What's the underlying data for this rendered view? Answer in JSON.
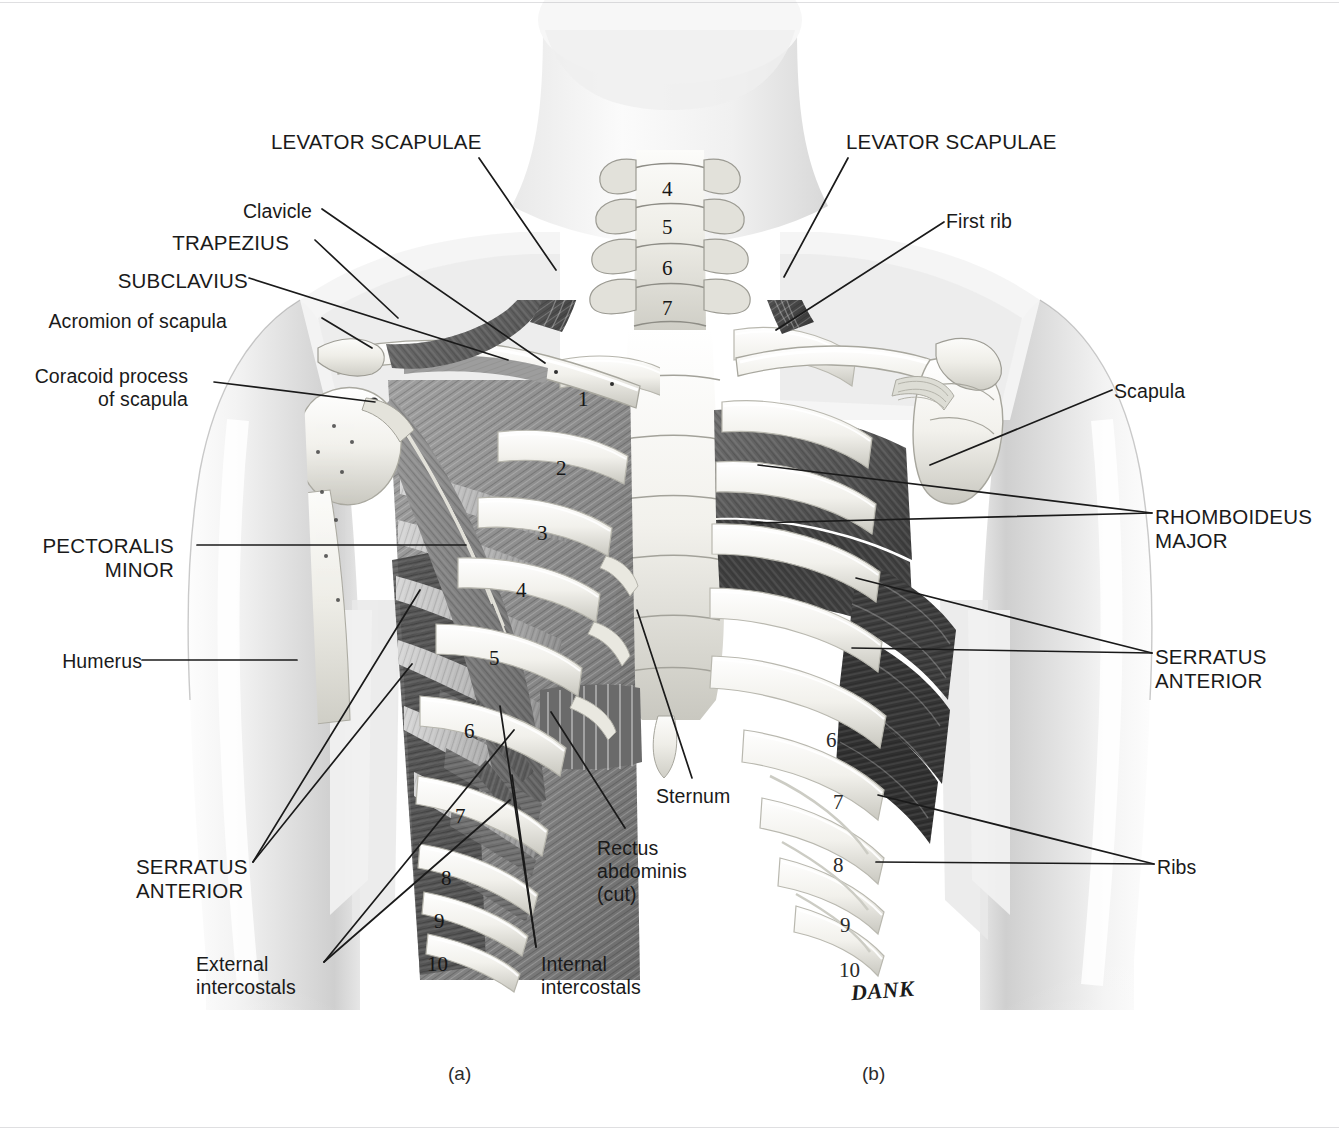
{
  "figure": {
    "type": "anatomical-illustration",
    "background_color": "#ffffff",
    "label_color": "#1a1a1a",
    "signature": "DANK"
  },
  "captions": [
    {
      "text": "(a)",
      "x": 448,
      "y": 1063
    },
    {
      "text": "(b)",
      "x": 862,
      "y": 1063
    }
  ],
  "labels": [
    {
      "id": "levator-scapulae-left",
      "text": "LEVATOR SCAPULAE",
      "style": "caps",
      "align": "ta-l",
      "x": 271,
      "y": 130
    },
    {
      "id": "levator-scapulae-right",
      "text": "LEVATOR SCAPULAE",
      "style": "caps",
      "align": "ta-l",
      "x": 846,
      "y": 130
    },
    {
      "id": "clavicle",
      "text": "Clavicle",
      "style": "mixed",
      "align": "ta-r",
      "x": 243,
      "y": 200
    },
    {
      "id": "trapezius",
      "text": "TRAPEZIUS",
      "style": "caps",
      "align": "ta-r",
      "x": 172,
      "y": 231
    },
    {
      "id": "subclavius",
      "text": "SUBCLAVIUS",
      "style": "caps",
      "align": "ta-r",
      "x": 118,
      "y": 269
    },
    {
      "id": "acromion-of-scapula",
      "text": "Acromion of scapula",
      "style": "mixed",
      "align": "ta-r",
      "x": 48,
      "y": 310
    },
    {
      "id": "coracoid-process-of-scapula",
      "text": "Coracoid process\nof scapula",
      "style": "mixed",
      "align": "ta-r",
      "x": 35,
      "y": 365
    },
    {
      "id": "pectoralis-minor",
      "text": "PECTORALIS\nMINOR",
      "style": "caps",
      "align": "ta-r",
      "x": 42,
      "y": 534
    },
    {
      "id": "humerus",
      "text": "Humerus",
      "style": "mixed",
      "align": "ta-r",
      "x": 62,
      "y": 650
    },
    {
      "id": "serratus-anterior-left",
      "text": "SERRATUS\nANTERIOR",
      "style": "caps",
      "align": "ta-l",
      "x": 136,
      "y": 855
    },
    {
      "id": "external-intercostals",
      "text": "External\nintercostals",
      "style": "mixed",
      "align": "ta-l",
      "x": 196,
      "y": 953
    },
    {
      "id": "internal-intercostals",
      "text": "Internal\nintercostals",
      "style": "mixed",
      "align": "ta-l",
      "x": 541,
      "y": 953
    },
    {
      "id": "rectus-abdominis-cut",
      "text": "Rectus\nabdominis\n(cut)",
      "style": "mixed",
      "align": "ta-l",
      "x": 597,
      "y": 837
    },
    {
      "id": "sternum",
      "text": "Sternum",
      "style": "mixed",
      "align": "ta-l",
      "x": 656,
      "y": 785
    },
    {
      "id": "first-rib",
      "text": "First rib",
      "style": "mixed",
      "align": "ta-l",
      "x": 946,
      "y": 210
    },
    {
      "id": "scapula",
      "text": "Scapula",
      "style": "mixed",
      "align": "ta-l",
      "x": 1114,
      "y": 380
    },
    {
      "id": "rhomboideus-major",
      "text": "RHOMBOIDEUS\nMAJOR",
      "style": "caps",
      "align": "ta-l",
      "x": 1155,
      "y": 505
    },
    {
      "id": "serratus-anterior-right",
      "text": "SERRATUS\nANTERIOR",
      "style": "caps",
      "align": "ta-l",
      "x": 1155,
      "y": 645
    },
    {
      "id": "ribs",
      "text": "Ribs",
      "style": "mixed",
      "align": "ta-l",
      "x": 1157,
      "y": 856
    }
  ],
  "leaders": [
    {
      "id": "leader-levator-scapulae-left",
      "points": "479,158 556,270"
    },
    {
      "id": "leader-levator-scapulae-right",
      "points": "848,158 784,277"
    },
    {
      "id": "leader-clavicle",
      "points": "322,209 545,363"
    },
    {
      "id": "leader-trapezius",
      "points": "315,240 398,318"
    },
    {
      "id": "leader-subclavius",
      "points": "249,278 508,360"
    },
    {
      "id": "leader-acromion",
      "points": "322,318 372,348"
    },
    {
      "id": "leader-coracoid",
      "points": "214,382 375,402"
    },
    {
      "id": "leader-pectoralis-minor",
      "points": "197,545 466,545"
    },
    {
      "id": "leader-humerus",
      "points": "142,660 297,660"
    },
    {
      "id": "leader-serratus-left-a",
      "points": "253,862 420,590"
    },
    {
      "id": "leader-serratus-left-b",
      "points": "253,862 412,664"
    },
    {
      "id": "leader-external-a",
      "points": "324,962 514,730"
    },
    {
      "id": "leader-external-b",
      "points": "324,962 510,800"
    },
    {
      "id": "leader-internal-a",
      "points": "536,947 500,706"
    },
    {
      "id": "leader-internal-b",
      "points": "536,947 512,775"
    },
    {
      "id": "leader-rectus",
      "points": "625,828 551,712"
    },
    {
      "id": "leader-sternum",
      "points": "692,778 637,610"
    },
    {
      "id": "leader-first-rib",
      "points": "944,222 776,330"
    },
    {
      "id": "leader-scapula",
      "points": "1112,390 930,465"
    },
    {
      "id": "leader-rhomboideus-a",
      "points": "1152,513 758,465"
    },
    {
      "id": "leader-rhomboideus-b",
      "points": "1152,513 752,523"
    },
    {
      "id": "leader-serratus-right-a",
      "points": "1152,653 856,578"
    },
    {
      "id": "leader-serratus-right-b",
      "points": "1152,653 852,648"
    },
    {
      "id": "leader-ribs-a",
      "points": "1154,864 878,795"
    },
    {
      "id": "leader-ribs-b",
      "points": "1154,864 876,862"
    }
  ],
  "rib_numbers_left": [
    {
      "n": "1",
      "x": 578,
      "y": 387
    },
    {
      "n": "2",
      "x": 556,
      "y": 456
    },
    {
      "n": "3",
      "x": 537,
      "y": 521
    },
    {
      "n": "4",
      "x": 516,
      "y": 578
    },
    {
      "n": "5",
      "x": 489,
      "y": 646
    },
    {
      "n": "6",
      "x": 464,
      "y": 719
    },
    {
      "n": "7",
      "x": 455,
      "y": 804
    },
    {
      "n": "8",
      "x": 441,
      "y": 866
    },
    {
      "n": "9",
      "x": 434,
      "y": 909
    },
    {
      "n": "10",
      "x": 427,
      "y": 952
    }
  ],
  "rib_numbers_right": [
    {
      "n": "6",
      "x": 826,
      "y": 728
    },
    {
      "n": "7",
      "x": 833,
      "y": 790
    },
    {
      "n": "8",
      "x": 833,
      "y": 853
    },
    {
      "n": "9",
      "x": 840,
      "y": 913
    },
    {
      "n": "10",
      "x": 839,
      "y": 958
    }
  ],
  "vertebra_numbers": [
    {
      "n": "4",
      "x": 662,
      "y": 177
    },
    {
      "n": "5",
      "x": 662,
      "y": 215
    },
    {
      "n": "6",
      "x": 662,
      "y": 256
    },
    {
      "n": "7",
      "x": 662,
      "y": 296
    }
  ],
  "signature_mark": {
    "text": "DANK",
    "x": 851,
    "y": 978
  }
}
